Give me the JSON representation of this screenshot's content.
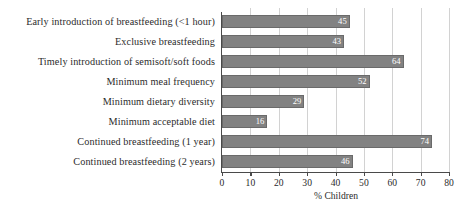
{
  "chart_data": {
    "type": "bar",
    "orientation": "horizontal",
    "title": "",
    "xlabel": "% Children",
    "ylabel": "",
    "xlim": [
      0,
      80
    ],
    "xticks": [
      0,
      10,
      20,
      30,
      40,
      50,
      60,
      70,
      80
    ],
    "grid": "vertical",
    "legend": null,
    "categories": [
      "Early introduction of breastfeeding (<1 hour)",
      "Exclusive breastfeeding",
      "Timely introduction of semisoft/soft foods",
      "Minimum meal frequency",
      "Minimum dietary diversity",
      "Minimum acceptable diet",
      "Continued breastfeeding (1 year)",
      "Continued breastfeeding (2 years)"
    ],
    "values": [
      45,
      43,
      64,
      52,
      29,
      16,
      74,
      46
    ],
    "data_labels": [
      "45",
      "43",
      "64",
      "52",
      "29",
      "16",
      "74",
      "46"
    ]
  },
  "style": {
    "bar_color": "#828282",
    "bar_edge_color": "#6a6a6a",
    "value_label_color": "#ffffff",
    "gridline_color": "#d2d2d2",
    "axis_color": "#4a4a4a",
    "text_color": "#2b2b2b",
    "background": "#ffffff"
  }
}
